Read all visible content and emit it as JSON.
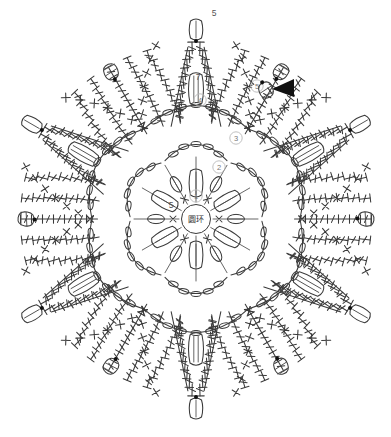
{
  "diagram": {
    "kind": "crochet-chart",
    "title_text": "",
    "background_color": "#ffffff",
    "ink_color": "#3a3a3a",
    "marker_color": "#111111",
    "symmetry": 6,
    "center": {
      "label": "圆环",
      "meaning_note": "ring"
    },
    "round_labels": [
      {
        "id": "r1",
        "text": "①",
        "x": 196,
        "y": 196
      },
      {
        "id": "r2",
        "text": "②",
        "x": 219,
        "y": 167
      },
      {
        "id": "r3",
        "text": "③",
        "x": 236,
        "y": 138
      },
      {
        "id": "r4",
        "text": "④",
        "x": 200,
        "y": 100
      },
      {
        "id": "r5",
        "text": "⑤",
        "x": 257,
        "y": 86
      }
    ],
    "count_labels": [
      {
        "id": "c_top",
        "text": "5",
        "x": 214,
        "y": 16
      },
      {
        "id": "c_mid",
        "text": "7",
        "x": 198,
        "y": 80
      },
      {
        "id": "c_center",
        "text": "5",
        "x": 171,
        "y": 208
      }
    ],
    "start_marker": {
      "name": "start-arrow",
      "x": 278,
      "y": 88,
      "color": "#111111"
    },
    "legend_symbols": [
      {
        "name": "chain-stitch",
        "glyph": "oval"
      },
      {
        "name": "single-crochet",
        "glyph": "X"
      },
      {
        "name": "double-crochet",
        "glyph": "T-bar"
      },
      {
        "name": "slip-stitch",
        "glyph": "dot"
      },
      {
        "name": "picot-loop",
        "glyph": "ring"
      }
    ]
  },
  "chart_data": {
    "type": "diagram",
    "title": "",
    "points": 6,
    "rounds": [
      {
        "round": 1,
        "label": "①",
        "stitch": "chain-loops",
        "repeats": 6
      },
      {
        "round": 2,
        "label": "②",
        "stitch": "chain-arcs",
        "repeats": 6
      },
      {
        "round": 3,
        "label": "③",
        "stitch": "chain-arcs",
        "repeats": 6
      },
      {
        "round": 4,
        "label": "④",
        "stitch": "double-crochet-fan",
        "repeats": 6
      },
      {
        "round": 5,
        "label": "⑤",
        "stitch": "single-crochet-edge-with-picots",
        "repeats": 6
      }
    ],
    "chain_counts": {
      "tip_loop": 5,
      "petal_loop": 7,
      "center_loop": 5
    }
  }
}
